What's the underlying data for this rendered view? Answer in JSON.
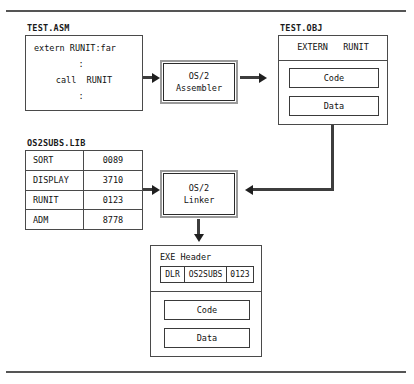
{
  "diagram": {
    "frame": {
      "top_rule": "",
      "bottom_rule": ""
    },
    "source_file": {
      "caption": "TEST.ASM",
      "lines": [
        "extern RUNIT:far",
        ":",
        "call  RUNIT",
        ":"
      ]
    },
    "assembler": {
      "line1": "OS/2",
      "line2": "Assembler"
    },
    "object_file": {
      "caption": "TEST.OBJ",
      "extern_label": "EXTERN   RUNIT",
      "code_label": "Code",
      "data_label": "Data"
    },
    "library": {
      "caption": "OS2SUBS.LIB",
      "rows": [
        {
          "name": "SORT",
          "value": "0089"
        },
        {
          "name": "DISPLAY",
          "value": "3710"
        },
        {
          "name": "RUNIT",
          "value": "0123"
        },
        {
          "name": "ADM",
          "value": "8778"
        }
      ]
    },
    "linker": {
      "line1": "OS/2",
      "line2": "Linker"
    },
    "executable": {
      "title": "EXE Header",
      "header_cells": [
        "DLR",
        "OS2SUBS",
        "0123"
      ],
      "code_label": "Code",
      "data_label": "Data"
    },
    "colors": {
      "ink": "#111111",
      "line": "#4a4a4a",
      "arrow": "#1f1f1f",
      "proc_outer": "#9a9a9a",
      "background": "#ffffff"
    }
  }
}
